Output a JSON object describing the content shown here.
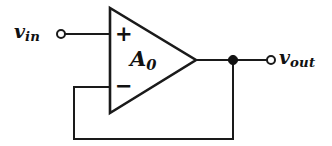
{
  "diagram": {
    "background_color": "#ffffff",
    "line_color": "#1a1a1a",
    "components": {
      "opamp": {
        "gain_label": "A",
        "gain_subscript": "0",
        "noninverting_input_sign": "+",
        "inverting_input_sign": "−",
        "shape": "triangle"
      },
      "input_terminal": {
        "label": "v",
        "label_subscript": "in",
        "terminal_type": "open-circle"
      },
      "output_terminal": {
        "label": "v",
        "label_subscript": "out",
        "terminal_type": "open-circle"
      },
      "output_junction": {
        "terminal_type": "filled-dot"
      },
      "feedback_path": {
        "description": "wire from output node to inverting input"
      }
    }
  }
}
